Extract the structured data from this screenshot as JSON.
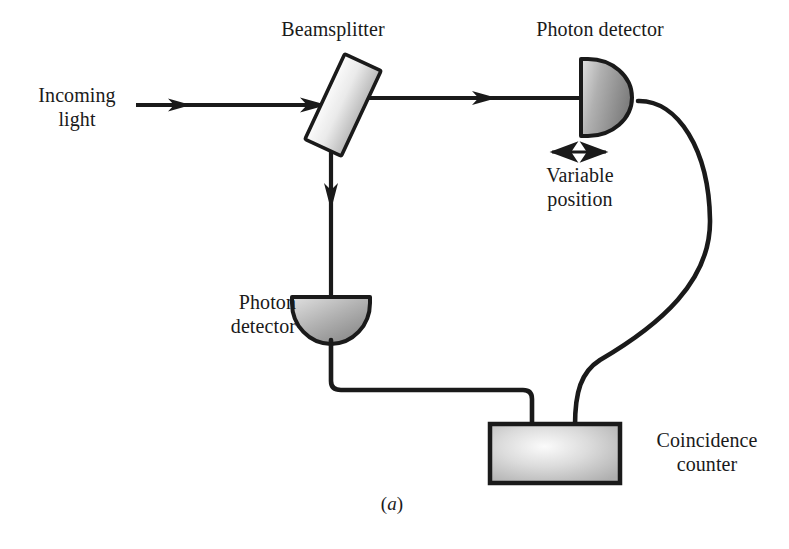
{
  "figure": {
    "caption_prefix": "(",
    "caption_letter": "a",
    "caption_suffix": ")",
    "background_color": "#ffffff",
    "ink_color": "#1a1a1a"
  },
  "labels": {
    "beamsplitter": "Beamsplitter",
    "detector_top": "Photon detector",
    "detector_bottom": "Photon\ndetector",
    "incoming_light": "Incoming\nlight",
    "variable_position": "Variable\nposition",
    "coincidence_counter": "Coincidence\ncounter"
  },
  "components": {
    "beamsplitter": {
      "name": "beamsplitter",
      "shape": "tilted-rectangle",
      "angle_deg": 25,
      "fill_light": "#f2f2f2",
      "fill_dark": "#bdbdbd",
      "stroke": "#1a1a1a"
    },
    "detector_top": {
      "name": "photon-detector-top",
      "shape": "d-shape-right",
      "fill_light": "#d8d8d8",
      "fill_dark": "#8a8a8a",
      "stroke": "#1a1a1a"
    },
    "detector_bottom": {
      "name": "photon-detector-bottom",
      "shape": "semicircle-down",
      "fill_light": "#d8d8d8",
      "fill_dark": "#8a8a8a",
      "stroke": "#1a1a1a"
    },
    "coincidence_counter": {
      "name": "coincidence-counter-box",
      "shape": "rectangle",
      "fill_light": "#f0f0f0",
      "fill_dark": "#b4b4b4",
      "stroke": "#1a1a1a"
    }
  },
  "beams": [
    {
      "name": "incoming-beam",
      "from": "left-edge",
      "to": "beamsplitter",
      "direction": "right"
    },
    {
      "name": "transmitted-beam",
      "from": "beamsplitter",
      "to": "detector-top",
      "direction": "right"
    },
    {
      "name": "reflected-beam",
      "from": "beamsplitter",
      "to": "detector-bottom",
      "direction": "down"
    }
  ],
  "wires": [
    {
      "name": "wire-top-detector-to-counter",
      "style": "curved"
    },
    {
      "name": "wire-bottom-detector-to-counter",
      "style": "right-angle-rounded"
    }
  ],
  "annotations": {
    "variable_position_arrow": {
      "name": "double-headed-arrow",
      "orientation": "horizontal"
    }
  }
}
